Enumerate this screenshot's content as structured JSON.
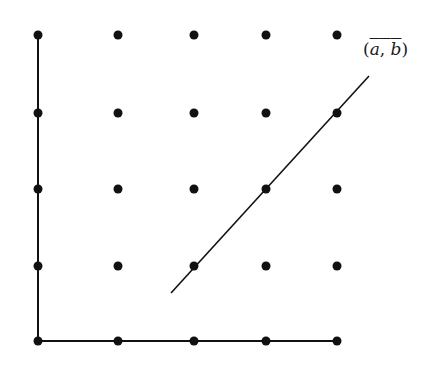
{
  "diagram": {
    "colors": {
      "ink": "#111111",
      "background": "#ffffff"
    },
    "grid": {
      "columns_x": [
        38,
        118,
        194,
        266,
        337
      ],
      "rows_y": [
        35,
        113,
        189,
        266,
        341
      ],
      "dot_radius": 4.5
    },
    "axes": {
      "vertical": {
        "x1": 38,
        "y1": 35,
        "x2": 38,
        "y2": 341
      },
      "horizontal": {
        "x1": 38,
        "y1": 341,
        "x2": 337,
        "y2": 341
      }
    },
    "line": {
      "x1": 171,
      "y1": 293,
      "x2": 369,
      "y2": 76
    },
    "label": {
      "open": "(",
      "a": "a",
      "comma": ", ",
      "b": "b",
      "close": ")",
      "overlined": true
    }
  }
}
